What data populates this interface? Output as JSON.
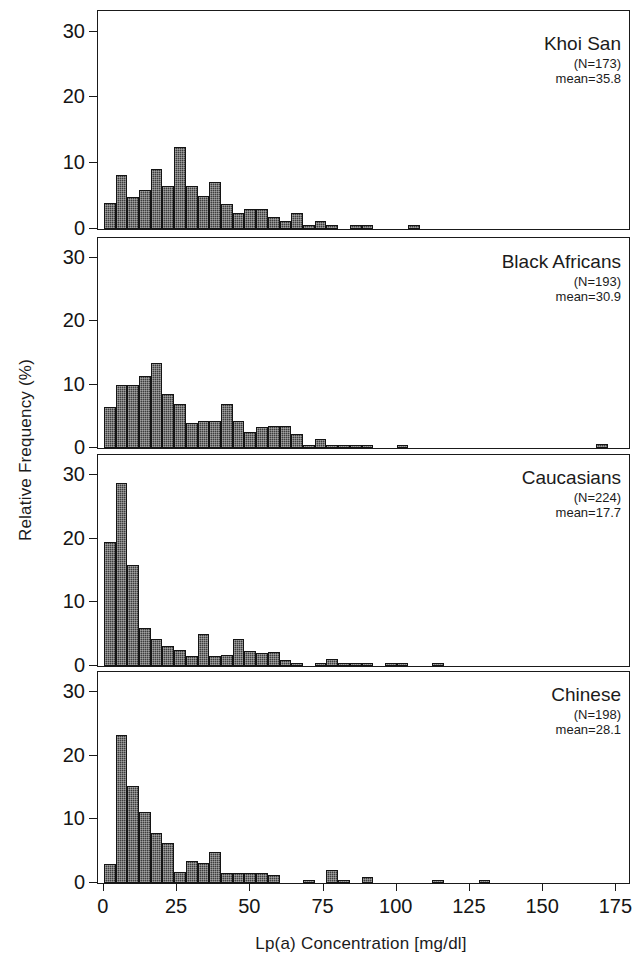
{
  "chart_data": {
    "type": "bar",
    "title": "",
    "xlabel": "Lp(a) Concentration [mg/dl]",
    "ylabel": "Relative Frequency  (%)",
    "xlim": [
      -2,
      180
    ],
    "ylim": [
      0,
      33
    ],
    "xticks": [
      0,
      25,
      50,
      75,
      100,
      125,
      150,
      175
    ],
    "yticks": [
      0,
      10,
      20,
      30
    ],
    "bin_width": 4,
    "grid": false,
    "legend": "none",
    "bar_color": "#3d3d3d",
    "axis_color": "#1a1a1a",
    "panels": [
      {
        "name": "Khoi San",
        "n_label": "(N=173)",
        "mean_label": "mean=35.8",
        "bin_starts": [
          0,
          4,
          8,
          12,
          16,
          20,
          24,
          28,
          32,
          36,
          40,
          44,
          48,
          52,
          56,
          60,
          64,
          68,
          72,
          76,
          80,
          84,
          88,
          92,
          96,
          100,
          104,
          108,
          112,
          116,
          120,
          124,
          128,
          132,
          136,
          140,
          144,
          148,
          152,
          156,
          160
        ],
        "values": [
          4.0,
          8.2,
          4.9,
          6.0,
          9.2,
          6.5,
          12.5,
          6.6,
          5.0,
          7.2,
          3.8,
          2.5,
          3.0,
          3.0,
          1.8,
          1.2,
          2.4,
          0.6,
          1.2,
          0.6,
          0,
          0.6,
          0.6,
          0,
          0,
          0,
          0.6,
          0,
          0,
          0,
          0,
          0,
          0,
          0,
          0,
          0,
          0,
          0,
          0,
          0,
          0
        ]
      },
      {
        "name": "Black Africans",
        "n_label": "(N=193)",
        "mean_label": "mean=30.9",
        "bin_starts": [
          0,
          4,
          8,
          12,
          16,
          20,
          24,
          28,
          32,
          36,
          40,
          44,
          48,
          52,
          56,
          60,
          64,
          68,
          72,
          76,
          80,
          84,
          88,
          92,
          96,
          100,
          104,
          108,
          112,
          116,
          120,
          124,
          128,
          132,
          136,
          140,
          144,
          148,
          152,
          156,
          160,
          164,
          168,
          172
        ],
        "values": [
          6.5,
          10.0,
          10.0,
          11.3,
          13.4,
          8.5,
          7.0,
          4.0,
          4.3,
          4.2,
          7.0,
          4.3,
          2.5,
          3.3,
          3.5,
          3.4,
          2.2,
          0.5,
          1.5,
          0.5,
          0.5,
          0.5,
          0.5,
          0,
          0,
          0.5,
          0,
          0,
          0,
          0,
          0,
          0,
          0,
          0,
          0,
          0,
          0,
          0,
          0,
          0,
          0,
          0,
          0.6,
          0
        ]
      },
      {
        "name": "Caucasians",
        "n_label": "(N=224)",
        "mean_label": "mean=17.7",
        "bin_starts": [
          0,
          4,
          8,
          12,
          16,
          20,
          24,
          28,
          32,
          36,
          40,
          44,
          48,
          52,
          56,
          60,
          64,
          68,
          72,
          76,
          80,
          84,
          88,
          92,
          96,
          100,
          104,
          108,
          112,
          116,
          120,
          124,
          128,
          132
        ],
        "values": [
          19.5,
          28.7,
          15.8,
          6.0,
          4.2,
          3.2,
          2.5,
          1.5,
          5.1,
          1.6,
          1.7,
          4.2,
          2.4,
          2.1,
          2.2,
          0.9,
          0.4,
          0,
          0.4,
          1.1,
          0.4,
          0.5,
          0.4,
          0,
          0.4,
          0.4,
          0,
          0,
          0.5,
          0,
          0,
          0,
          0,
          0
        ]
      },
      {
        "name": "Chinese",
        "n_label": "(N=198)",
        "mean_label": "mean=28.1",
        "bin_starts": [
          0,
          4,
          8,
          12,
          16,
          20,
          24,
          28,
          32,
          36,
          40,
          44,
          48,
          52,
          56,
          60,
          64,
          68,
          72,
          76,
          80,
          84,
          88,
          92,
          96,
          100,
          104,
          108,
          112,
          116,
          120,
          124,
          128,
          132,
          136,
          140,
          144,
          148,
          152,
          156,
          160
        ],
        "values": [
          3.0,
          23.3,
          15.2,
          11.2,
          7.8,
          6.3,
          1.8,
          3.5,
          3.2,
          4.8,
          1.5,
          1.5,
          1.5,
          1.5,
          1.3,
          0,
          0,
          0.5,
          0,
          2.0,
          0.5,
          0,
          1.0,
          0,
          0,
          0,
          0,
          0,
          0.5,
          0,
          0,
          0,
          0.5,
          0,
          0,
          0,
          0,
          0,
          0,
          0,
          0
        ]
      }
    ]
  }
}
